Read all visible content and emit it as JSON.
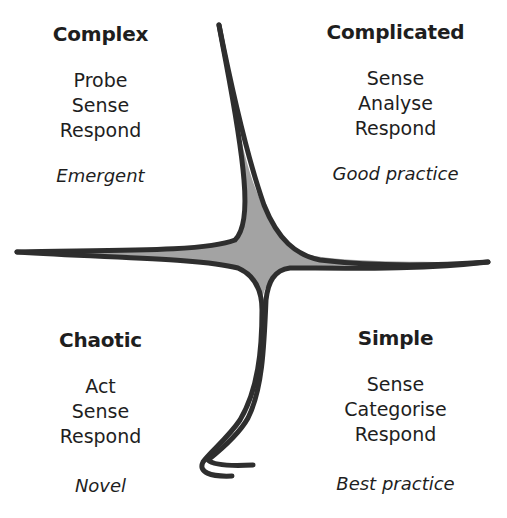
{
  "diagram": {
    "type": "cynefin-framework",
    "colors": {
      "line": "#2e2e2e",
      "center_fill": "#a3a3a3",
      "text": "#1e1e1e",
      "background": "#ffffff"
    },
    "center_label": "",
    "quadrants": {
      "complex": {
        "title": "Complex",
        "steps": [
          "Probe",
          "Sense",
          "Respond"
        ],
        "practice": "Emergent"
      },
      "complicated": {
        "title": "Complicated",
        "steps": [
          "Sense",
          "Analyse",
          "Respond"
        ],
        "practice": "Good practice"
      },
      "chaotic": {
        "title": "Chaotic",
        "steps": [
          "Act",
          "Sense",
          "Respond"
        ],
        "practice": "Novel"
      },
      "simple": {
        "title": "Simple",
        "steps": [
          "Sense",
          "Categorise",
          "Respond"
        ],
        "practice": "Best practice"
      }
    }
  }
}
